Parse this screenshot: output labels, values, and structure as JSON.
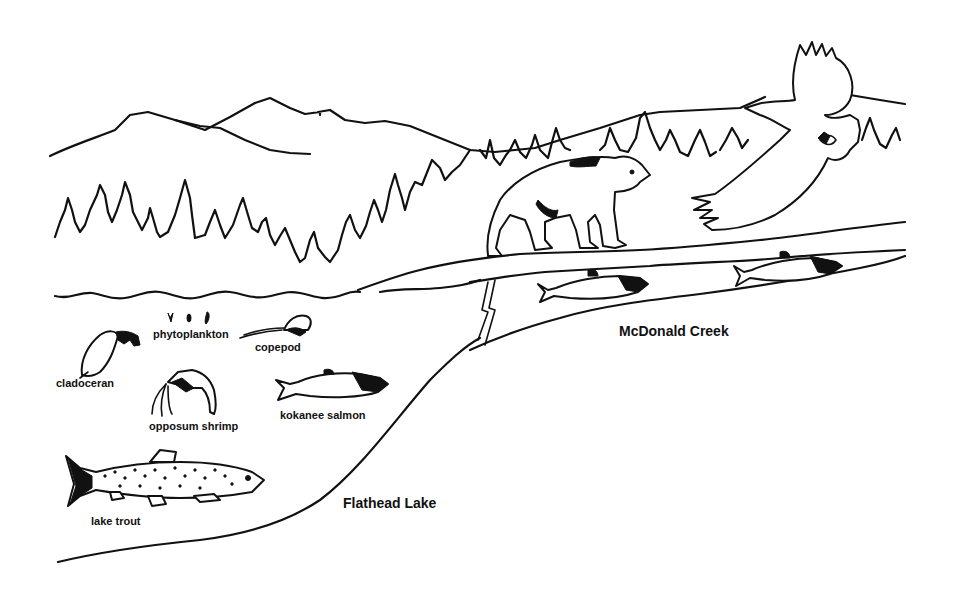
{
  "diagram": {
    "type": "food-web illustration",
    "colors": {
      "line": "#111111",
      "background": "#ffffff"
    },
    "locations": {
      "lake": "Flathead Lake",
      "creek": "McDonald Creek"
    },
    "organisms": {
      "phytoplankton": "phytoplankton",
      "copepod": "copepod",
      "cladoceran": "cladoceran",
      "opposum_shrimp": "opposum shrimp",
      "kokanee_salmon": "kokanee salmon",
      "lake_trout": "lake trout"
    },
    "unlabeled_figures": [
      "grizzly bear",
      "bald eagle",
      "spawning kokanee salmon (x2)",
      "mountains",
      "conifer forest"
    ]
  }
}
